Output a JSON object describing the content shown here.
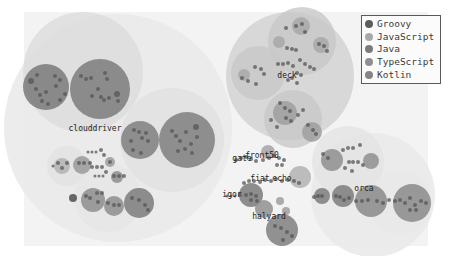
{
  "chart_data": {
    "type": "circle-packing",
    "title": "",
    "legend": {
      "position": "top-right",
      "entries": [
        {
          "name": "Groovy",
          "color": "#5d5d5d"
        },
        {
          "name": "JavaScript",
          "color": "#a9a9a9"
        },
        {
          "name": "Java",
          "color": "#7b7b7b"
        },
        {
          "name": "TypeScript",
          "color": "#8f8f8f"
        },
        {
          "name": "Kotlin",
          "color": "#858585"
        }
      ]
    },
    "background": {
      "x": 24,
      "y": 12,
      "w": 404,
      "h": 234,
      "color": "#f3f3f3"
    },
    "repositories": [
      {
        "name": "clouddriver",
        "label_x": 95,
        "label_y": 131,
        "outer": {
          "cx": 118,
          "cy": 128,
          "r": 114
        }
      },
      {
        "name": "deck",
        "label_x": 287,
        "label_y": 78,
        "outer": {
          "cx": 290,
          "cy": 76,
          "r": 64
        }
      },
      {
        "name": "gate",
        "label_x": 242,
        "label_y": 161
      },
      {
        "name": "front50",
        "label_x": 262,
        "label_y": 158
      },
      {
        "name": "fiat",
        "label_x": 260,
        "label_y": 181
      },
      {
        "name": "echo",
        "label_x": 282,
        "label_y": 181
      },
      {
        "name": "igor",
        "label_x": 232,
        "label_y": 197
      },
      {
        "name": "halyard",
        "label_x": 269,
        "label_y": 219
      },
      {
        "name": "orca",
        "label_x": 364,
        "label_y": 191,
        "outer": {
          "cx": 373,
          "cy": 195,
          "r": 62
        }
      }
    ],
    "groups": [
      {
        "cx": 83,
        "cy": 72,
        "r": 60,
        "fill": "#dcdcdc"
      },
      {
        "cx": 172,
        "cy": 140,
        "r": 52,
        "fill": "#e1e1e1"
      },
      {
        "cx": 67,
        "cy": 166,
        "r": 20,
        "fill": "#e2e2e2"
      },
      {
        "cx": 108,
        "cy": 198,
        "r": 34,
        "fill": "#e6e6e6"
      },
      {
        "cx": 348,
        "cy": 162,
        "r": 36,
        "fill": "#e3e3e3"
      },
      {
        "cx": 302,
        "cy": 41,
        "r": 34,
        "fill": "#c8c8c8"
      },
      {
        "cx": 258,
        "cy": 73,
        "r": 27,
        "fill": "#c8c8c8"
      },
      {
        "cx": 293,
        "cy": 119,
        "r": 29,
        "fill": "#c8c8c8"
      },
      {
        "cx": 400,
        "cy": 202,
        "r": 32,
        "fill": "#e8e8e8"
      }
    ],
    "packages": [
      {
        "cx": 46,
        "cy": 87,
        "r": 23,
        "fill": "#7a7a7a"
      },
      {
        "cx": 100,
        "cy": 89,
        "r": 30,
        "fill": "#7d7d7d"
      },
      {
        "cx": 140,
        "cy": 140,
        "r": 19,
        "fill": "#7f7f7f"
      },
      {
        "cx": 187,
        "cy": 140,
        "r": 28,
        "fill": "#7f7f7f"
      },
      {
        "cx": 82,
        "cy": 165,
        "r": 9,
        "fill": "#9a9a9a"
      },
      {
        "cx": 62,
        "cy": 166,
        "r": 8,
        "fill": "#b3b3b3"
      },
      {
        "cx": 110,
        "cy": 162,
        "r": 5,
        "fill": "#9c9c9c"
      },
      {
        "cx": 117,
        "cy": 177,
        "r": 6,
        "fill": "#8c8c8c"
      },
      {
        "cx": 93,
        "cy": 200,
        "r": 12,
        "fill": "#8d8d8d"
      },
      {
        "cx": 114,
        "cy": 206,
        "r": 10,
        "fill": "#8d8d8d"
      },
      {
        "cx": 139,
        "cy": 203,
        "r": 15,
        "fill": "#7b7b7b"
      },
      {
        "cx": 73,
        "cy": 198,
        "r": 4,
        "fill": "#4f4f4f"
      },
      {
        "cx": 301,
        "cy": 26,
        "r": 9,
        "fill": "#a8a8a8"
      },
      {
        "cx": 279,
        "cy": 42,
        "r": 6,
        "fill": "#a8a8a8"
      },
      {
        "cx": 321,
        "cy": 45,
        "r": 8,
        "fill": "#a8a8a8"
      },
      {
        "cx": 244,
        "cy": 75,
        "r": 6,
        "fill": "#a9a9a9"
      },
      {
        "cx": 285,
        "cy": 113,
        "r": 12,
        "fill": "#9f9f9f"
      },
      {
        "cx": 312,
        "cy": 132,
        "r": 10,
        "fill": "#9f9f9f"
      },
      {
        "cx": 268,
        "cy": 152,
        "r": 7,
        "fill": "#a3a3a3"
      },
      {
        "cx": 300,
        "cy": 177,
        "r": 11,
        "fill": "#b2b2b2"
      },
      {
        "cx": 251,
        "cy": 195,
        "r": 12,
        "fill": "#7a7a7a"
      },
      {
        "cx": 264,
        "cy": 209,
        "r": 9,
        "fill": "#8f8f8f"
      },
      {
        "cx": 282,
        "cy": 230,
        "r": 16,
        "fill": "#7f7f7f"
      },
      {
        "cx": 280,
        "cy": 201,
        "r": 4,
        "fill": "#9d9d9d"
      },
      {
        "cx": 286,
        "cy": 211,
        "r": 4,
        "fill": "#9d9d9d"
      },
      {
        "cx": 332,
        "cy": 160,
        "r": 11,
        "fill": "#8f8f8f"
      },
      {
        "cx": 371,
        "cy": 161,
        "r": 8,
        "fill": "#8f8f8f"
      },
      {
        "cx": 322,
        "cy": 196,
        "r": 8,
        "fill": "#7c7c7c"
      },
      {
        "cx": 343,
        "cy": 196,
        "r": 11,
        "fill": "#7c7c7c"
      },
      {
        "cx": 371,
        "cy": 201,
        "r": 16,
        "fill": "#8a8a8a"
      },
      {
        "cx": 412,
        "cy": 203,
        "r": 19,
        "fill": "#8a8a8a"
      }
    ],
    "dots": [
      [
        31,
        81,
        3
      ],
      [
        37,
        75,
        2
      ],
      [
        36,
        89,
        2
      ],
      [
        40,
        95,
        2
      ],
      [
        46,
        92,
        2
      ],
      [
        55,
        76,
        2
      ],
      [
        60,
        80,
        2
      ],
      [
        56,
        86,
        2
      ],
      [
        60,
        100,
        2
      ],
      [
        65,
        94,
        2
      ],
      [
        42,
        101,
        2
      ],
      [
        48,
        104,
        2
      ],
      [
        81,
        76,
        2
      ],
      [
        86,
        79,
        2
      ],
      [
        91,
        78,
        2
      ],
      [
        105,
        73,
        2
      ],
      [
        107,
        79,
        2
      ],
      [
        98,
        89,
        2
      ],
      [
        101,
        97,
        2
      ],
      [
        104,
        100,
        2
      ],
      [
        109,
        98,
        2
      ],
      [
        117,
        94,
        3
      ],
      [
        118,
        101,
        2
      ],
      [
        92,
        96,
        2
      ],
      [
        134,
        130,
        2
      ],
      [
        139,
        132,
        2
      ],
      [
        142,
        138,
        2
      ],
      [
        146,
        133,
        2
      ],
      [
        131,
        141,
        2
      ],
      [
        133,
        150,
        2
      ],
      [
        141,
        153,
        2
      ],
      [
        148,
        141,
        2
      ],
      [
        172,
        131,
        2
      ],
      [
        176,
        136,
        2
      ],
      [
        180,
        141,
        2
      ],
      [
        186,
        132,
        2
      ],
      [
        191,
        144,
        2
      ],
      [
        197,
        137,
        2
      ],
      [
        178,
        151,
        2
      ],
      [
        185,
        149,
        2
      ],
      [
        192,
        153,
        2
      ],
      [
        196,
        127,
        3
      ],
      [
        58,
        163,
        2
      ],
      [
        62,
        168,
        2
      ],
      [
        67,
        163,
        2
      ],
      [
        79,
        163,
        2
      ],
      [
        84,
        163,
        2
      ],
      [
        90,
        163,
        2
      ],
      [
        53,
        166,
        1.5
      ],
      [
        88,
        152,
        1.5
      ],
      [
        92,
        152,
        1.5
      ],
      [
        96,
        152,
        1.5
      ],
      [
        101,
        150,
        2
      ],
      [
        104,
        155,
        2
      ],
      [
        92,
        167,
        2
      ],
      [
        97,
        167,
        2
      ],
      [
        102,
        167,
        2
      ],
      [
        106,
        172,
        2
      ],
      [
        110,
        162,
        2
      ],
      [
        95,
        176,
        1.5
      ],
      [
        99,
        176,
        1.5
      ],
      [
        103,
        176,
        1.5
      ],
      [
        114,
        176,
        2
      ],
      [
        119,
        176,
        2
      ],
      [
        124,
        176,
        2
      ],
      [
        86,
        196,
        2
      ],
      [
        90,
        198,
        2
      ],
      [
        97,
        193,
        2
      ],
      [
        102,
        193,
        2
      ],
      [
        98,
        202,
        2
      ],
      [
        108,
        203,
        2
      ],
      [
        114,
        205,
        2
      ],
      [
        119,
        205,
        2
      ],
      [
        132,
        198,
        2
      ],
      [
        139,
        200,
        2
      ],
      [
        145,
        205,
        2
      ],
      [
        148,
        210,
        2
      ],
      [
        286,
        28,
        2
      ],
      [
        296,
        26,
        2
      ],
      [
        302,
        24,
        2
      ],
      [
        305,
        32,
        2
      ],
      [
        287,
        48,
        2
      ],
      [
        292,
        49,
        2
      ],
      [
        296,
        50,
        2
      ],
      [
        319,
        44,
        2
      ],
      [
        324,
        46,
        2
      ],
      [
        327,
        51,
        2
      ],
      [
        278,
        64,
        2
      ],
      [
        283,
        64,
        2
      ],
      [
        288,
        63,
        2
      ],
      [
        293,
        66,
        2
      ],
      [
        300,
        60,
        2
      ],
      [
        305,
        64,
        2
      ],
      [
        310,
        67,
        2
      ],
      [
        314,
        69,
        2
      ],
      [
        297,
        73,
        2
      ],
      [
        301,
        75,
        2
      ],
      [
        255,
        67,
        2
      ],
      [
        261,
        69,
        2
      ],
      [
        264,
        74,
        2
      ],
      [
        242,
        78,
        2
      ],
      [
        248,
        81,
        2
      ],
      [
        256,
        84,
        2
      ],
      [
        288,
        80,
        2
      ],
      [
        292,
        78,
        2
      ],
      [
        297,
        83,
        2
      ],
      [
        280,
        103,
        2
      ],
      [
        285,
        108,
        2
      ],
      [
        290,
        111,
        2
      ],
      [
        286,
        118,
        2
      ],
      [
        291,
        121,
        2
      ],
      [
        298,
        115,
        2
      ],
      [
        303,
        110,
        2
      ],
      [
        308,
        125,
        2
      ],
      [
        313,
        130,
        2
      ],
      [
        316,
        134,
        2
      ],
      [
        277,
        127,
        2
      ],
      [
        271,
        120,
        2
      ],
      [
        236,
        160,
        2
      ],
      [
        241,
        158,
        2
      ],
      [
        246,
        157,
        2
      ],
      [
        251,
        159,
        2
      ],
      [
        256,
        161,
        2
      ],
      [
        263,
        160,
        2
      ],
      [
        269,
        158,
        2
      ],
      [
        274,
        156,
        2
      ],
      [
        279,
        158,
        2
      ],
      [
        284,
        160,
        2
      ],
      [
        277,
        165,
        2
      ],
      [
        282,
        165,
        2
      ],
      [
        244,
        183,
        2
      ],
      [
        249,
        181,
        2
      ],
      [
        254,
        181,
        2
      ],
      [
        260,
        182,
        2
      ],
      [
        265,
        180,
        2
      ],
      [
        271,
        181,
        2
      ],
      [
        276,
        179,
        2
      ],
      [
        282,
        181,
        2
      ],
      [
        288,
        180,
        2
      ],
      [
        294,
        181,
        2
      ],
      [
        299,
        183,
        2
      ],
      [
        227,
        196,
        1.5
      ],
      [
        231,
        196,
        1.5
      ],
      [
        235,
        196,
        1.5
      ],
      [
        240,
        195,
        2
      ],
      [
        246,
        195,
        2
      ],
      [
        251,
        194,
        2
      ],
      [
        256,
        196,
        2
      ],
      [
        251,
        200,
        2
      ],
      [
        257,
        201,
        2
      ],
      [
        275,
        226,
        2
      ],
      [
        281,
        228,
        2
      ],
      [
        287,
        232,
        2
      ],
      [
        292,
        236,
        2
      ],
      [
        283,
        240,
        2
      ],
      [
        323,
        154,
        2
      ],
      [
        328,
        158,
        2
      ],
      [
        343,
        150,
        2
      ],
      [
        348,
        148,
        2
      ],
      [
        353,
        148,
        2
      ],
      [
        360,
        145,
        2
      ],
      [
        349,
        162,
        2
      ],
      [
        353,
        162,
        2
      ],
      [
        358,
        162,
        2
      ],
      [
        363,
        165,
        2
      ],
      [
        345,
        168,
        2
      ],
      [
        352,
        171,
        2
      ],
      [
        314,
        197,
        2
      ],
      [
        318,
        196,
        2
      ],
      [
        322,
        196,
        2
      ],
      [
        336,
        196,
        2
      ],
      [
        340,
        197,
        2
      ],
      [
        344,
        200,
        2
      ],
      [
        349,
        198,
        2
      ],
      [
        356,
        201,
        2
      ],
      [
        362,
        201,
        2
      ],
      [
        368,
        200,
        2
      ],
      [
        377,
        201,
        2
      ],
      [
        383,
        203,
        2
      ],
      [
        389,
        200,
        2
      ],
      [
        395,
        201,
        2
      ],
      [
        400,
        200,
        2
      ],
      [
        405,
        203,
        2
      ],
      [
        410,
        198,
        2
      ],
      [
        415,
        205,
        2
      ],
      [
        421,
        201,
        2
      ],
      [
        426,
        203,
        2
      ],
      [
        410,
        210,
        2
      ],
      [
        416,
        210,
        2
      ]
    ]
  }
}
